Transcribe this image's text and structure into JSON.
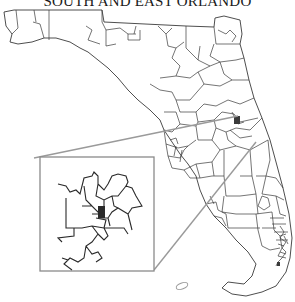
{
  "map": {
    "title": "SOUTH AND EAST ORLANDO",
    "subject": "Florida district boundaries",
    "inset": {
      "label": "magnified-inset",
      "frame_color": "#8a8a8a"
    },
    "colors": {
      "boundary": "#3a3a3a",
      "leader_line": "#9a9a9a",
      "background": "#ffffff"
    }
  }
}
